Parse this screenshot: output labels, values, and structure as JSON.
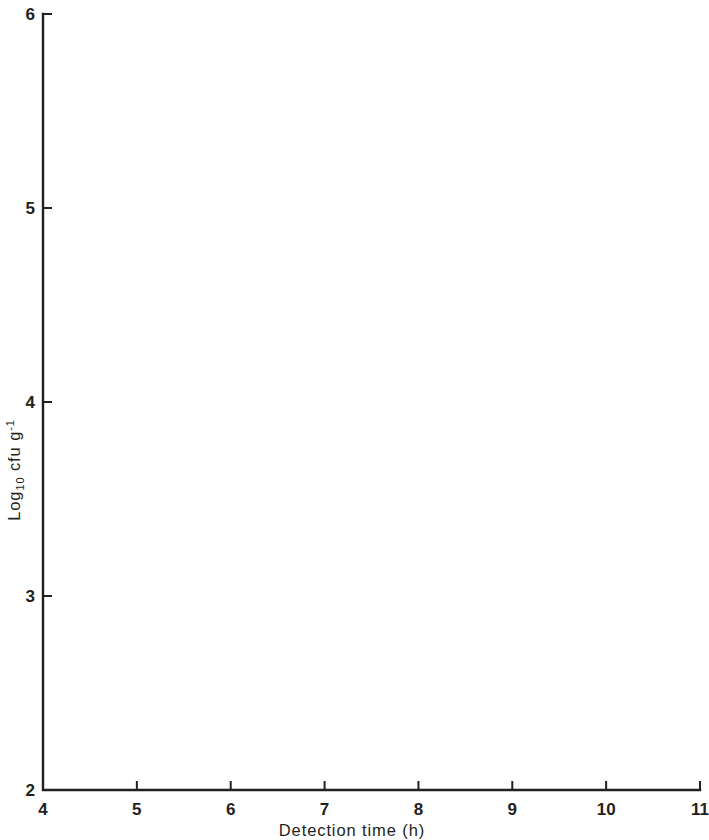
{
  "chart_data": {
    "type": "scatter",
    "title": "",
    "xlabel": "Detection time (h)",
    "ylabel": "Log10 cfu g-1",
    "ylabel_parts": {
      "base": "Log",
      "sub": "10",
      "mid": " cfu g",
      "sup": "-1"
    },
    "xlim": [
      4,
      11
    ],
    "ylim": [
      2,
      6
    ],
    "xticks": [
      "4",
      "5",
      "6",
      "7",
      "8",
      "9",
      "10",
      "11"
    ],
    "yticks": [
      "2",
      "3",
      "4",
      "5",
      "6"
    ],
    "grid": false,
    "legend_position": "top-right",
    "regression_line": {
      "label": "fitted regression line",
      "solid_segment": {
        "x1": 4.0,
        "y1": 5.6,
        "x2": 8.55,
        "y2": 3.62
      },
      "dashed_segment": {
        "x1": 8.55,
        "y1": 3.62,
        "x2": 11.0,
        "y2": 2.02
      },
      "slope": -0.435,
      "intercept": 7.34
    },
    "crosshairs": [
      {
        "name": "upper-threshold-crosshair",
        "x": 5.25,
        "y": 5.0,
        "x_from": 4.55,
        "x_to": 6.25,
        "y_from": 5.55,
        "y_to": 4.53
      },
      {
        "name": "lower-threshold-crosshair",
        "x": 7.15,
        "y": 4.0,
        "x_from": 6.25,
        "x_to": 8.05,
        "y_from": 4.6,
        "y_to": 3.48
      }
    ],
    "count_labels": [
      {
        "x": 5.12,
        "y": 5.0,
        "n": "4"
      },
      {
        "x": 6.2,
        "y": 4.93,
        "n": "2"
      },
      {
        "x": 6.2,
        "y": 4.79,
        "n": "2"
      },
      {
        "x": 6.2,
        "y": 4.72,
        "n": "2"
      },
      {
        "x": 6.03,
        "y": 4.68,
        "n": "2"
      },
      {
        "x": 6.33,
        "y": 4.73,
        "n": "2"
      },
      {
        "x": 6.45,
        "y": 4.75,
        "n": "2"
      },
      {
        "x": 6.6,
        "y": 4.73,
        "n": "2"
      },
      {
        "x": 6.6,
        "y": 4.79,
        "n": "2"
      },
      {
        "x": 6.72,
        "y": 4.76,
        "n": "2"
      },
      {
        "x": 6.9,
        "y": 4.77,
        "n": "2"
      },
      {
        "x": 6.5,
        "y": 4.52,
        "n": "2"
      },
      {
        "x": 6.52,
        "y": 4.36,
        "n": "3"
      },
      {
        "x": 6.78,
        "y": 4.37,
        "n": "2"
      },
      {
        "x": 6.95,
        "y": 4.37,
        "n": "2"
      },
      {
        "x": 7.12,
        "y": 4.38,
        "n": "3"
      },
      {
        "x": 6.52,
        "y": 4.29,
        "n": "2"
      },
      {
        "x": 6.52,
        "y": 4.24,
        "n": "2"
      },
      {
        "x": 6.78,
        "y": 4.26,
        "n": "2"
      },
      {
        "x": 6.95,
        "y": 4.26,
        "n": "2"
      },
      {
        "x": 8.2,
        "y": 3.99,
        "n": "2"
      }
    ],
    "points": [
      {
        "x": 4.62,
        "y": 5.12
      },
      {
        "x": 4.78,
        "y": 5.06
      },
      {
        "x": 4.55,
        "y": 5.0
      },
      {
        "x": 4.9,
        "y": 5.0
      },
      {
        "x": 5.12,
        "y": 5.0
      },
      {
        "x": 5.25,
        "y": 5.0
      },
      {
        "x": 5.42,
        "y": 5.0
      },
      {
        "x": 6.05,
        "y": 5.0
      },
      {
        "x": 5.42,
        "y": 5.07
      },
      {
        "x": 4.72,
        "y": 4.88
      },
      {
        "x": 5.28,
        "y": 4.93
      },
      {
        "x": 5.28,
        "y": 4.86
      },
      {
        "x": 5.28,
        "y": 4.8
      },
      {
        "x": 5.28,
        "y": 4.77
      },
      {
        "x": 6.05,
        "y": 4.93
      },
      {
        "x": 6.05,
        "y": 4.86
      },
      {
        "x": 6.42,
        "y": 4.93
      },
      {
        "x": 6.42,
        "y": 4.86
      },
      {
        "x": 6.42,
        "y": 4.8
      },
      {
        "x": 6.42,
        "y": 4.74
      },
      {
        "x": 6.42,
        "y": 4.68
      },
      {
        "x": 6.42,
        "y": 4.62
      },
      {
        "x": 6.6,
        "y": 4.8
      },
      {
        "x": 6.6,
        "y": 4.74
      },
      {
        "x": 6.6,
        "y": 4.68
      },
      {
        "x": 6.6,
        "y": 4.62
      },
      {
        "x": 6.22,
        "y": 4.74
      },
      {
        "x": 6.22,
        "y": 4.68
      },
      {
        "x": 6.22,
        "y": 4.62
      },
      {
        "x": 5.42,
        "y": 4.73
      },
      {
        "x": 5.42,
        "y": 4.6
      },
      {
        "x": 5.72,
        "y": 4.4
      },
      {
        "x": 5.95,
        "y": 4.73
      },
      {
        "x": 5.95,
        "y": 4.62
      },
      {
        "x": 6.78,
        "y": 4.62
      },
      {
        "x": 7.72,
        "y": 4.85
      },
      {
        "x": 6.05,
        "y": 4.68
      },
      {
        "x": 6.05,
        "y": 4.62
      },
      {
        "x": 6.25,
        "y": 4.52
      },
      {
        "x": 6.25,
        "y": 4.45
      },
      {
        "x": 6.0,
        "y": 4.36
      },
      {
        "x": 6.25,
        "y": 4.36
      },
      {
        "x": 6.45,
        "y": 4.45
      },
      {
        "x": 6.45,
        "y": 4.36
      },
      {
        "x": 6.62,
        "y": 4.45
      },
      {
        "x": 6.62,
        "y": 4.36
      },
      {
        "x": 6.85,
        "y": 4.45
      },
      {
        "x": 6.85,
        "y": 4.36
      },
      {
        "x": 7.2,
        "y": 4.45
      },
      {
        "x": 7.2,
        "y": 4.38
      },
      {
        "x": 6.25,
        "y": 4.26
      },
      {
        "x": 6.25,
        "y": 4.2
      },
      {
        "x": 6.45,
        "y": 4.26
      },
      {
        "x": 6.62,
        "y": 4.26
      },
      {
        "x": 6.85,
        "y": 4.26
      },
      {
        "x": 7.05,
        "y": 4.26
      },
      {
        "x": 7.25,
        "y": 4.26
      },
      {
        "x": 7.52,
        "y": 4.26
      },
      {
        "x": 7.72,
        "y": 4.26
      },
      {
        "x": 7.9,
        "y": 4.26
      },
      {
        "x": 7.52,
        "y": 4.5
      },
      {
        "x": 7.9,
        "y": 4.5
      },
      {
        "x": 7.52,
        "y": 4.38
      },
      {
        "x": 7.9,
        "y": 4.38
      },
      {
        "x": 6.85,
        "y": 4.18
      },
      {
        "x": 6.85,
        "y": 4.12
      },
      {
        "x": 7.52,
        "y": 4.2
      },
      {
        "x": 7.52,
        "y": 4.12
      },
      {
        "x": 7.52,
        "y": 4.06
      },
      {
        "x": 7.15,
        "y": 4.22
      },
      {
        "x": 6.25,
        "y": 4.0
      },
      {
        "x": 6.6,
        "y": 4.0
      },
      {
        "x": 7.15,
        "y": 4.0
      },
      {
        "x": 7.52,
        "y": 4.0
      },
      {
        "x": 8.05,
        "y": 4.0
      },
      {
        "x": 6.25,
        "y": 3.85
      },
      {
        "x": 7.72,
        "y": 3.85
      },
      {
        "x": 9.8,
        "y": 3.8
      },
      {
        "x": 9.8,
        "y": 2.57
      },
      {
        "x": 10.62,
        "y": 2.68
      }
    ]
  },
  "legend": {
    "quadrants": {
      "top_left": "Agree",
      "top_right": "False -ve",
      "bottom_left": "False +ve",
      "bottom_right": "Agree"
    },
    "note_line1": "2,3 and 4 indicate number",
    "note_line2": "of coincidental points"
  },
  "colors": {
    "ink": "#231f20",
    "point": "#111111",
    "dashed": "#6a6a6a",
    "crosshair": "#4a4a4a",
    "background": "#ffffff"
  }
}
